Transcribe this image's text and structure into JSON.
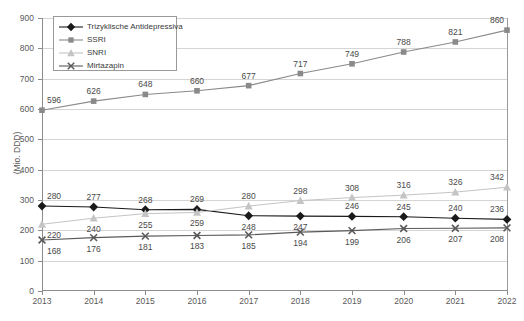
{
  "chart_data": {
    "type": "line",
    "title": "",
    "subtitle": "",
    "xlabel": "",
    "ylabel": "(Mio. DDD)",
    "x": [
      2013,
      2014,
      2015,
      2016,
      2017,
      2018,
      2019,
      2020,
      2021,
      2022
    ],
    "categories": [
      "2013",
      "2014",
      "2015",
      "2016",
      "2017",
      "2018",
      "2019",
      "2020",
      "2021",
      "2022"
    ],
    "ylim": [
      0,
      900
    ],
    "yticks": [
      0,
      100,
      200,
      300,
      400,
      500,
      600,
      700,
      800,
      900
    ],
    "ytick_labels": [
      "0",
      "100",
      "200",
      "300",
      "400",
      "500",
      "600",
      "700",
      "800",
      "900"
    ],
    "grid": true,
    "legend_position": "top-left",
    "series": [
      {
        "name": "Trizyklische Antidepressiva",
        "marker": "diamond",
        "color": "#1a1a1a",
        "values": [
          280,
          277,
          268,
          269,
          248,
          247,
          246,
          245,
          240,
          236
        ],
        "label_positions": [
          "above",
          "above",
          "above",
          "above",
          "below",
          "below",
          "above",
          "above",
          "above",
          "above"
        ]
      },
      {
        "name": "SSRI",
        "marker": "square",
        "color": "#8a8a8a",
        "values": [
          596,
          626,
          648,
          660,
          677,
          717,
          749,
          788,
          821,
          860
        ],
        "label_positions": [
          "above",
          "above",
          "above",
          "above",
          "above",
          "above",
          "above",
          "above",
          "above",
          "above"
        ]
      },
      {
        "name": "SNRI",
        "marker": "triangle",
        "color": "#c4c4c4",
        "values": [
          220,
          240,
          255,
          259,
          280,
          298,
          308,
          316,
          326,
          342
        ],
        "label_positions": [
          "below",
          "below",
          "below",
          "below",
          "above",
          "above",
          "above",
          "above",
          "above",
          "above"
        ]
      },
      {
        "name": "Mirtazapin",
        "marker": "x",
        "color": "#5a5a5a",
        "values": [
          168,
          176,
          181,
          183,
          185,
          194,
          199,
          206,
          207,
          208
        ],
        "label_positions": [
          "below",
          "below",
          "below",
          "below",
          "below",
          "below",
          "below",
          "below",
          "below",
          "below"
        ]
      }
    ]
  },
  "colors": {
    "axis": "#8c8c8c",
    "grid": "#d5d5d5",
    "text": "#595959",
    "background": "#ffffff"
  }
}
